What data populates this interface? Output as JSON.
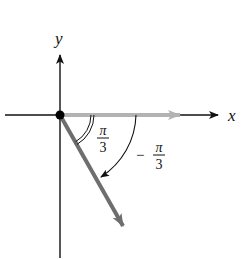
{
  "diagram": {
    "axes": {
      "x_label": "x",
      "y_label": "y"
    },
    "angles": [
      {
        "name": "reference-angle",
        "numerator": "π",
        "denominator": "3",
        "sign": "",
        "arc_style": "double"
      },
      {
        "name": "directed-angle",
        "numerator": "π",
        "denominator": "3",
        "sign": "−",
        "arc_style": "single-with-arrow",
        "direction": "clockwise"
      }
    ],
    "rays": [
      {
        "name": "initial-side",
        "angle_deg": 0,
        "color": "#a9a9a9"
      },
      {
        "name": "terminal-side",
        "angle_deg": -60,
        "color": "#707070"
      }
    ],
    "colors": {
      "axis": "#111111",
      "initial_ray": "#a9a9a9",
      "terminal_ray": "#707070",
      "background": "#ffffff"
    }
  }
}
